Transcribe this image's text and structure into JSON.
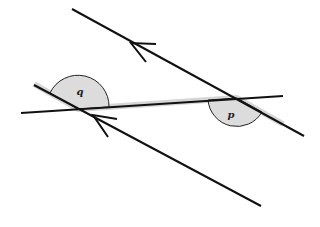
{
  "diagram": {
    "type": "parallel-lines-transversal-angles",
    "colors": {
      "line": "#111111",
      "highlight": "#d2d2d2",
      "angle_fill": "#dcdcdc",
      "angle_stroke": "#222222",
      "background": "#ffffff"
    },
    "lines": {
      "upper_parallel": {
        "x1": 72,
        "y1": 9,
        "x2": 304,
        "y2": 136
      },
      "lower_parallel": {
        "x1": 34,
        "y1": 85,
        "x2": 261,
        "y2": 206
      },
      "transversal": {
        "x1": 21,
        "y1": 113,
        "x2": 283,
        "y2": 96
      }
    },
    "highlight_path": "M 34 84 L 78 109 L 237 98 L 283 124",
    "angles": [
      {
        "id": "q",
        "label": "q",
        "vertex": [
          78,
          109
        ],
        "label_pos": [
          80,
          95
        ],
        "arc": "M 78 109 L 50 93 A 31 31 0 0 1 109 107 Z"
      },
      {
        "id": "p",
        "label": "p",
        "vertex": [
          237,
          98
        ],
        "label_pos": [
          231,
          118
        ],
        "arc": "M 237 98 L 262 112 A 29 29 0 0 1 208 100 Z"
      }
    ],
    "arrows": [
      {
        "id": "upper-arrow",
        "tip": [
          131,
          43
        ],
        "barb1": [
          156,
          44
        ],
        "barb2": [
          146,
          62
        ]
      },
      {
        "id": "lower-arrow",
        "tip": [
          93,
          115
        ],
        "barb1": [
          117,
          119
        ],
        "barb2": [
          108,
          137
        ]
      }
    ]
  }
}
